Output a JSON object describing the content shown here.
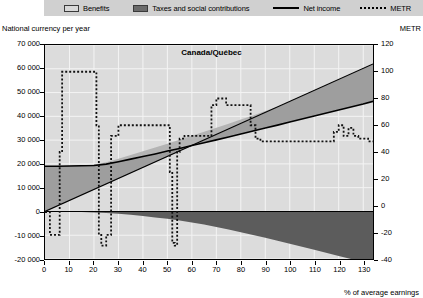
{
  "legend": {
    "items": [
      {
        "label": "Benefits",
        "marker": "filled-box-light",
        "color": "#d8d8d8"
      },
      {
        "label": "Taxes and social contributions",
        "marker": "filled-box-dark",
        "color": "#6b6b6b"
      },
      {
        "label": "Net income",
        "marker": "solid-line",
        "color": "#000000"
      },
      {
        "label": "METR",
        "marker": "dotted-line",
        "color": "#000000"
      }
    ]
  },
  "chart_data": {
    "type": "area",
    "title": "Canada/Québec",
    "xlabel": "% of average earnings",
    "ylabel": "National currency per year",
    "y2label": "METR",
    "xlim": [
      0,
      134
    ],
    "ylim": [
      -20000,
      70000
    ],
    "y2lim": [
      -40,
      120
    ],
    "grid": true,
    "legend_position": "top",
    "xticks": [
      0,
      10,
      20,
      30,
      40,
      50,
      60,
      70,
      80,
      90,
      100,
      110,
      120,
      130
    ],
    "yticks": [
      -20000,
      -10000,
      0,
      10000,
      20000,
      30000,
      40000,
      50000,
      60000,
      70000
    ],
    "yticklabels": [
      "-20 000",
      "-10 000",
      "0",
      "10 000",
      "20 000",
      "30 000",
      "40 000",
      "50 000",
      "60 000",
      "70 000"
    ],
    "y2ticks": [
      -40,
      -20,
      0,
      20,
      40,
      60,
      80,
      100,
      120
    ],
    "y2ticklabels": [
      "-40",
      "-20",
      "0",
      "20",
      "40",
      "60",
      "80",
      "100",
      "120"
    ],
    "series": [
      {
        "name": "Gross earnings",
        "axis": "left",
        "type": "line-boundary",
        "x": [
          0,
          134
        ],
        "values": [
          0,
          62000
        ]
      },
      {
        "name": "Benefits",
        "axis": "left",
        "type": "band-upper",
        "comment": "upper boundary of benefits band = gross earnings + benefits",
        "x": [
          0,
          5,
          10,
          15,
          20,
          25,
          30,
          35,
          40,
          45,
          50,
          55,
          60,
          65,
          70,
          75,
          80,
          85,
          90,
          95,
          100,
          110,
          120,
          130,
          134
        ],
        "values": [
          19000,
          19000,
          19200,
          19400,
          19700,
          20700,
          22200,
          23700,
          25300,
          26900,
          28500,
          30100,
          31800,
          33500,
          35200,
          36900,
          38700,
          40400,
          42200,
          44000,
          45800,
          49500,
          53200,
          57000,
          58500
        ]
      },
      {
        "name": "Taxes and social contributions",
        "axis": "left",
        "type": "band-lower",
        "comment": "lower boundary below zero = negative of taxes paid",
        "x": [
          0,
          5,
          10,
          15,
          20,
          25,
          30,
          35,
          40,
          45,
          50,
          55,
          60,
          65,
          70,
          75,
          80,
          85,
          90,
          95,
          100,
          110,
          120,
          130,
          134
        ],
        "values": [
          0,
          0,
          -100,
          -250,
          -450,
          -700,
          -1000,
          -1400,
          -1900,
          -2500,
          -3100,
          -3800,
          -4600,
          -5500,
          -6500,
          -7600,
          -8700,
          -9900,
          -11100,
          -12300,
          -13600,
          -16100,
          -18700,
          -21300,
          -22400
        ]
      },
      {
        "name": "Net income",
        "axis": "left",
        "type": "line",
        "x": [
          0,
          5,
          10,
          15,
          20,
          25,
          30,
          35,
          40,
          45,
          50,
          55,
          60,
          65,
          70,
          75,
          80,
          85,
          90,
          95,
          100,
          110,
          120,
          130,
          134
        ],
        "values": [
          19000,
          19000,
          19100,
          19200,
          19300,
          19900,
          20900,
          22000,
          23100,
          24200,
          25400,
          26500,
          27700,
          28900,
          30100,
          31300,
          32600,
          33800,
          35100,
          36300,
          37600,
          40100,
          42700,
          45200,
          46300
        ]
      },
      {
        "name": "METR",
        "axis": "right",
        "type": "step-dotted",
        "x": [
          0,
          2,
          3,
          5,
          6,
          7,
          8,
          10,
          12,
          14,
          16,
          18,
          19,
          20,
          21,
          22,
          23,
          25,
          27,
          30,
          33,
          36,
          39,
          42,
          45,
          48,
          50,
          51,
          52,
          53,
          54,
          55,
          57,
          60,
          62,
          64,
          66,
          68,
          70,
          72,
          74,
          76,
          78,
          80,
          82,
          84,
          86,
          88,
          90,
          92,
          95,
          98,
          101,
          104,
          107,
          110,
          113,
          116,
          118,
          120,
          122,
          124,
          126,
          128,
          130,
          132,
          134
        ],
        "values": [
          -5,
          -22,
          -22,
          -22,
          40,
          100,
          100,
          100,
          100,
          100,
          100,
          100,
          100,
          100,
          60,
          -22,
          -30,
          -22,
          52,
          60,
          60,
          60,
          60,
          60,
          60,
          60,
          60,
          25,
          -28,
          -30,
          40,
          50,
          52,
          52,
          52,
          52,
          52,
          75,
          80,
          80,
          75,
          75,
          75,
          75,
          75,
          60,
          50,
          48,
          48,
          48,
          48,
          48,
          48,
          48,
          48,
          48,
          48,
          48,
          55,
          60,
          52,
          58,
          52,
          50,
          50,
          48,
          48
        ]
      }
    ]
  }
}
